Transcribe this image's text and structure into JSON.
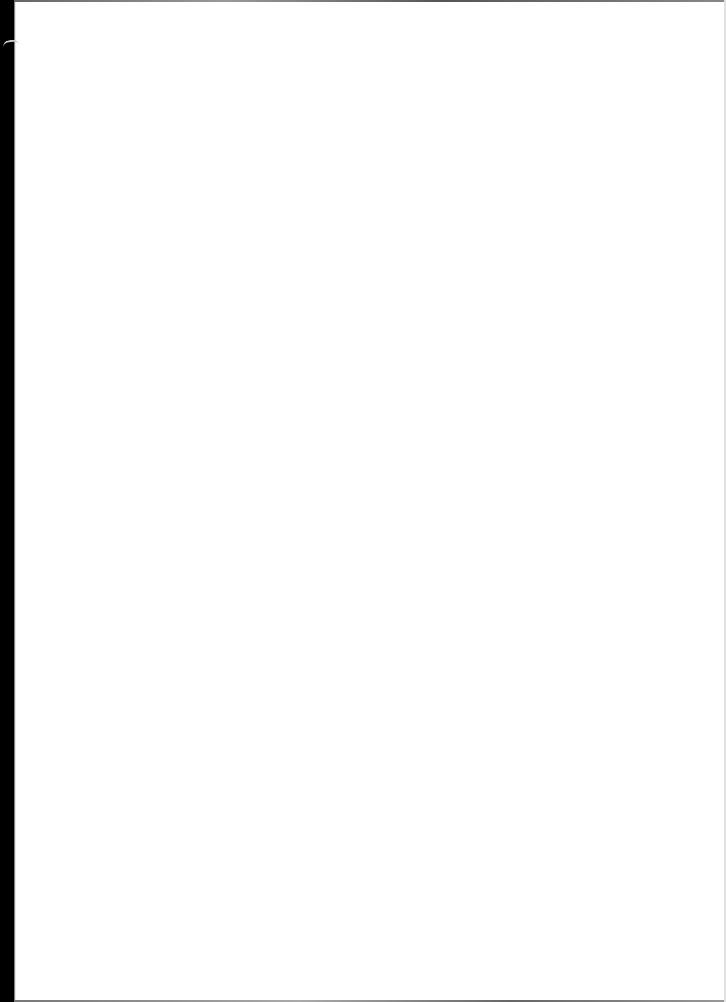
{
  "document": {
    "type": "scanned-page",
    "content_text": "",
    "is_blank": true
  },
  "colors": {
    "paper": "#ffffff",
    "left_edge": "#000000",
    "border": "#888888"
  }
}
